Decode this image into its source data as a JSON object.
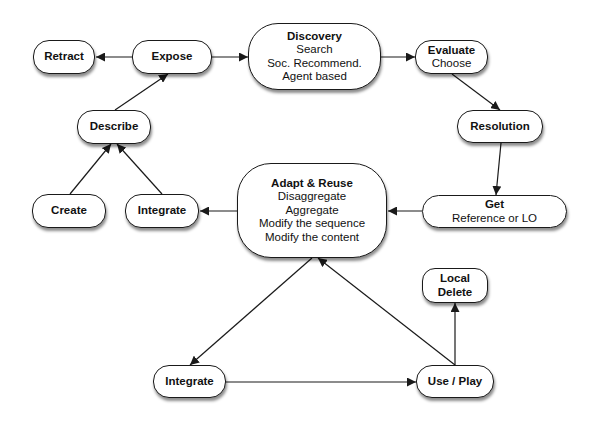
{
  "diagram": {
    "nodes": {
      "retract": {
        "title": "Retract",
        "lines": []
      },
      "expose": {
        "title": "Expose",
        "lines": []
      },
      "discovery": {
        "title": "Discovery",
        "lines": [
          "Search",
          "Soc. Recommend.",
          "Agent based"
        ]
      },
      "evaluate": {
        "title": "Evaluate",
        "lines": [
          "Choose"
        ]
      },
      "resolution": {
        "title": "Resolution",
        "lines": []
      },
      "describe": {
        "title": "Describe",
        "lines": []
      },
      "create": {
        "title": "Create",
        "lines": []
      },
      "integrate_top": {
        "title": "Integrate",
        "lines": []
      },
      "adapt_reuse": {
        "title": "Adapt & Reuse",
        "lines": [
          "Disaggregate",
          "Aggregate",
          "Modify the sequence",
          "Modify the content"
        ]
      },
      "get": {
        "title": "Get",
        "lines": [
          "Reference or LO"
        ]
      },
      "local_delete": {
        "title": "Local",
        "lines": [
          "Delete"
        ]
      },
      "integrate_bottom": {
        "title": "Integrate",
        "lines": []
      },
      "use_play": {
        "title": "Use / Play",
        "lines": []
      }
    },
    "edges": [
      {
        "from": "expose",
        "to": "retract"
      },
      {
        "from": "expose",
        "to": "discovery"
      },
      {
        "from": "discovery",
        "to": "evaluate"
      },
      {
        "from": "evaluate",
        "to": "resolution"
      },
      {
        "from": "resolution",
        "to": "get"
      },
      {
        "from": "get",
        "to": "adapt_reuse"
      },
      {
        "from": "adapt_reuse",
        "to": "integrate_top"
      },
      {
        "from": "create",
        "to": "describe"
      },
      {
        "from": "integrate_top",
        "to": "describe"
      },
      {
        "from": "describe",
        "to": "expose"
      },
      {
        "from": "adapt_reuse",
        "to": "integrate_bottom"
      },
      {
        "from": "integrate_bottom",
        "to": "use_play"
      },
      {
        "from": "use_play",
        "to": "adapt_reuse"
      },
      {
        "from": "use_play",
        "to": "local_delete"
      }
    ],
    "colors": {
      "stroke": "#1a1a1a",
      "fill": "#ffffff",
      "background": "#ffffff"
    }
  }
}
